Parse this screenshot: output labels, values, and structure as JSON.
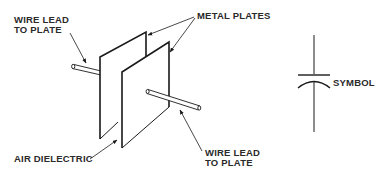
{
  "figure": {
    "type": "capacitor-construction-diagram",
    "line_color": "#1a1a1a",
    "background": "#ffffff"
  },
  "labels": {
    "wire_lead_top": {
      "line1": "WIRE LEAD",
      "line2": "TO PLATE"
    },
    "metal_plates": "METAL PLATES",
    "air_dielectric": "AIR DIELECTRIC",
    "wire_lead_bottom": {
      "line1": "WIRE LEAD",
      "line2": "TO PLATE"
    },
    "symbol": "SYMBOL"
  },
  "components": [
    {
      "name": "back-metal-plate",
      "description": "metal plate (rear)"
    },
    {
      "name": "front-metal-plate",
      "description": "metal plate (front)"
    },
    {
      "name": "rear-wire-lead",
      "description": "wire lead to rear plate"
    },
    {
      "name": "front-wire-lead",
      "description": "wire lead to front plate"
    },
    {
      "name": "capacitor-symbol",
      "description": "schematic symbol: straight plate over curved plate"
    }
  ]
}
